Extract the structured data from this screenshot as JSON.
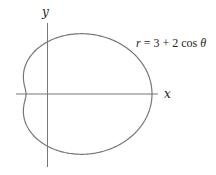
{
  "diagram": {
    "equation": {
      "r": "r",
      "rest": " = 3 + 2 cos ",
      "theta": "θ"
    },
    "axes": {
      "x_label": "x",
      "y_label": "y"
    },
    "curve": {
      "a": 3,
      "b": 2,
      "function": "cos",
      "origin_px": [
        47,
        94
      ],
      "scale_x": 21,
      "scale_y": 17.3,
      "stroke": "#777777"
    },
    "axis_color": "#777777"
  }
}
